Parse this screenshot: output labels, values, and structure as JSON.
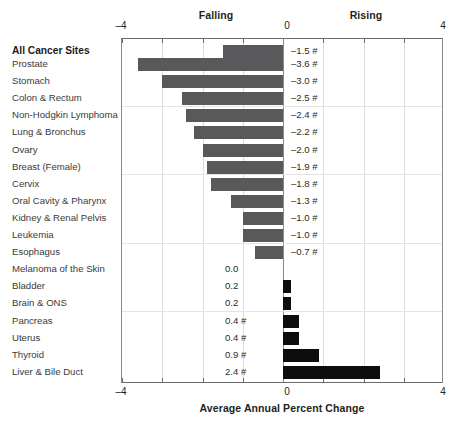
{
  "chart_data": {
    "type": "bar",
    "orientation": "horizontal",
    "title": "",
    "xlabel": "Average Annual Percent Change",
    "ylabel": "",
    "xlim": [
      -4,
      4
    ],
    "xticks": [
      -4,
      0,
      4
    ],
    "xtick_labels": [
      "–4",
      "0",
      "4"
    ],
    "grid": true,
    "legend": "none",
    "direction_labels": {
      "negative": "Falling",
      "positive": "Rising"
    },
    "significance_marker": "#",
    "categories": [
      "All Cancer Sites",
      "Prostate",
      "Stomach",
      "Colon & Rectum",
      "Non-Hodgkin Lymphoma",
      "Lung & Bronchus",
      "Ovary",
      "Breast (Female)",
      "Cervix",
      "Oral Cavity & Pharynx",
      "Kidney & Renal Pelvis",
      "Leukemia",
      "Esophagus",
      "Melanoma of the Skin",
      "Bladder",
      "Brain & ONS",
      "Pancreas",
      "Uterus",
      "Thyroid",
      "Liver & Bile Duct"
    ],
    "values": [
      -1.5,
      -3.6,
      -3.0,
      -2.5,
      -2.4,
      -2.2,
      -2.0,
      -1.9,
      -1.8,
      -1.3,
      -1.0,
      -1.0,
      -0.7,
      0.0,
      0.2,
      0.2,
      0.4,
      0.4,
      0.9,
      2.4
    ],
    "value_labels": [
      "–1.5 #",
      "–3.6 #",
      "–3.0 #",
      "–2.5 #",
      "–2.4 #",
      "–2.2 #",
      "–2.0 #",
      "–1.9 #",
      "–1.8 #",
      "–1.3 #",
      "–1.0 #",
      "–1.0 #",
      "–0.7 #",
      "0.0",
      "0.2",
      "0.2",
      "0.4 #",
      "0.4 #",
      "0.9 #",
      "2.4 #"
    ],
    "emphasized_categories": [
      "All Cancer Sites"
    ],
    "colors": {
      "negative_bar": "#59595b",
      "positive_bar": "#0d0d0d",
      "axis": "#6b6b6b",
      "gridline": "#dcdcdc",
      "text": "#231f20"
    }
  }
}
